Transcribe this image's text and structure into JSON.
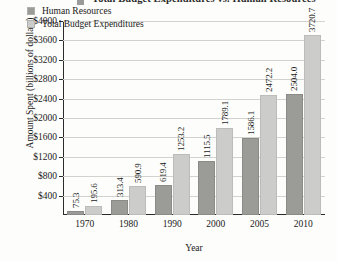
{
  "chart_data": {
    "type": "bar",
    "title": "Total Budget Expenditures vs. Human Resources",
    "title_visible_fragment": "penditures vs. Human Resources",
    "xlabel": "Year",
    "ylabel": "Amount Spent (billions of dollars)",
    "categories": [
      "1970",
      "1980",
      "1990",
      "2000",
      "2005",
      "2010"
    ],
    "series": [
      {
        "name": "Human Resources",
        "color": "#9b9b98",
        "values": [
          75.3,
          313.4,
          619.4,
          1115.5,
          1586.1,
          2504.0
        ],
        "labels": [
          "75.3",
          "313.4",
          "619.4",
          "1115.5",
          "1586.1",
          "2504.0"
        ]
      },
      {
        "name": "Total Budget Expenditures",
        "color": "#cccccb",
        "values": [
          195.6,
          590.9,
          1253.2,
          1789.1,
          2472.2,
          3720.7
        ],
        "labels": [
          "195.6",
          "590.9",
          "1253.2",
          "1789.1",
          "2472.2",
          "3720.7"
        ]
      }
    ],
    "ylim": [
      0,
      4000
    ],
    "yticks": [
      400,
      800,
      1200,
      1600,
      2000,
      2400,
      2800,
      3200,
      3600,
      4000
    ],
    "ytick_labels": [
      "$400",
      "$800",
      "$1200",
      "$1600",
      "$2000",
      "$2400",
      "$2800",
      "$3200",
      "$3600",
      "$4000"
    ],
    "grid": true,
    "legend_position": "top-left-inside",
    "bar_value_labels": true,
    "bar_value_label_rotation": -90
  },
  "legend": {
    "items": [
      {
        "label": "Human Resources"
      },
      {
        "label": "Total Budget Expenditures"
      }
    ]
  },
  "axes": {
    "x": {
      "title": "Year"
    },
    "y": {
      "title": "Amount Spent (billions of dollars)"
    }
  }
}
